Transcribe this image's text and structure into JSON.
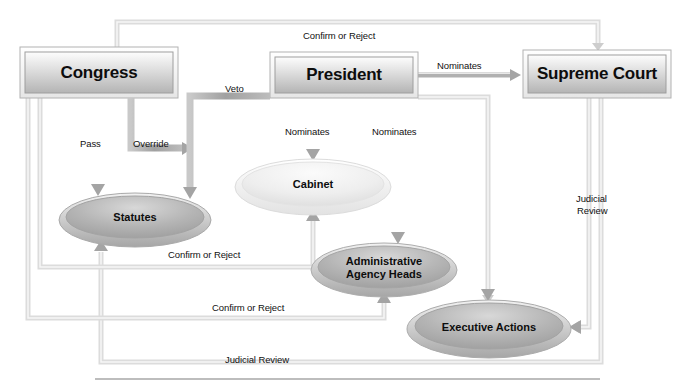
{
  "diagram": {
    "colors": {
      "box_fill_light": "#f3f3f3",
      "box_fill_dark": "#b9b9b9",
      "box_border": "#9b9b9b",
      "ellipse_dark": "#a8a8a8",
      "ellipse_light": "#ededed",
      "arrow_dark": "#a2a2a2",
      "arrow_light": "#dedede",
      "text": "#111111",
      "baseline_rule": "#b5b5b5"
    },
    "boxes": [
      {
        "id": "congress",
        "label": "Congress",
        "x": 20,
        "y": 47,
        "w": 158,
        "h": 51
      },
      {
        "id": "president",
        "label": "President",
        "x": 270,
        "y": 52,
        "w": 148,
        "h": 46
      },
      {
        "id": "supreme_court",
        "label": "Supreme Court",
        "x": 523,
        "y": 50,
        "w": 148,
        "h": 48
      }
    ],
    "ellipses": [
      {
        "id": "statutes",
        "label": "Statutes",
        "cx": 135,
        "cy": 218,
        "rx": 75,
        "ry": 26,
        "shade": "dark"
      },
      {
        "id": "cabinet",
        "label": "Cabinet",
        "cx": 313,
        "cy": 185,
        "rx": 77,
        "ry": 27,
        "shade": "light"
      },
      {
        "id": "agency_heads",
        "label": "Administrative\nAgency Heads",
        "cx": 384,
        "cy": 268,
        "rx": 72,
        "ry": 26,
        "shade": "dark"
      },
      {
        "id": "executive_actions",
        "label": "Executive Actions",
        "cx": 489,
        "cy": 327,
        "rx": 81,
        "ry": 28,
        "shade": "dark"
      }
    ],
    "edges": [
      {
        "id": "congress-pass-statutes",
        "label": "Pass",
        "from": "congress",
        "to": "statutes",
        "tone": "dark"
      },
      {
        "id": "congress-override-veto",
        "label": "Override",
        "from": "congress",
        "to": "statutes",
        "tone": "dark"
      },
      {
        "id": "president-veto-statutes",
        "label": "Veto",
        "from": "president",
        "to": "statutes",
        "tone": "dark"
      },
      {
        "id": "president-nominates-cabinet",
        "label": "Nominates",
        "from": "president",
        "to": "cabinet",
        "tone": "dark"
      },
      {
        "id": "president-nominates-agency-heads",
        "label": "Nominates",
        "from": "president",
        "to": "agency_heads",
        "tone": "dark"
      },
      {
        "id": "president-nominates-supreme-court",
        "label": "Nominates",
        "from": "president",
        "to": "supreme_court",
        "tone": "dark"
      },
      {
        "id": "congress-confirm-or-reject-court",
        "label": "Confirm or Reject",
        "from": "congress",
        "to": "supreme_court",
        "tone": "light"
      },
      {
        "id": "congress-confirm-or-reject-cabinet",
        "label": "Confirm or Reject",
        "from": "congress",
        "to": "cabinet",
        "tone": "light"
      },
      {
        "id": "congress-confirm-or-reject-agencies",
        "label": "Confirm or Reject",
        "from": "congress",
        "to": "agency_heads",
        "tone": "light"
      },
      {
        "id": "court-judicial-review-executive",
        "label": "Judicial\nReview",
        "from": "supreme_court",
        "to": "executive_actions",
        "tone": "light"
      },
      {
        "id": "court-judicial-review-statutes",
        "label": "Judicial Review",
        "from": "supreme_court",
        "to": "statutes",
        "tone": "light"
      },
      {
        "id": "president-to-executive-actions",
        "label": "",
        "from": "president",
        "to": "executive_actions",
        "tone": "light"
      }
    ],
    "edge_labels": [
      {
        "id": "label-confirm-or-reject-top",
        "text": "Confirm or Reject",
        "x": 303,
        "y": 31,
        "align": "left"
      },
      {
        "id": "label-veto",
        "text": "Veto",
        "x": 225,
        "y": 84,
        "align": "left"
      },
      {
        "id": "label-nominates-supreme-court",
        "text": "Nominates",
        "x": 437,
        "y": 61,
        "align": "left"
      },
      {
        "id": "label-pass",
        "text": "Pass",
        "x": 80,
        "y": 139,
        "align": "left"
      },
      {
        "id": "label-override",
        "text": "Override",
        "x": 133,
        "y": 139,
        "align": "left"
      },
      {
        "id": "label-nominates-cabinet",
        "text": "Nominates",
        "x": 285,
        "y": 127,
        "align": "left"
      },
      {
        "id": "label-nominates-agency-heads",
        "text": "Nominates",
        "x": 372,
        "y": 127,
        "align": "left"
      },
      {
        "id": "label-confirm-or-reject-cabinet",
        "text": "Confirm or Reject",
        "x": 168,
        "y": 250,
        "align": "left"
      },
      {
        "id": "label-confirm-or-reject-agency",
        "text": "Confirm or Reject",
        "x": 212,
        "y": 303,
        "align": "left"
      },
      {
        "id": "label-judicial-review-right",
        "text": "Judicial",
        "x": 576,
        "y": 194,
        "align": "left"
      },
      {
        "id": "label-judicial-review-right-2",
        "text": "Review",
        "x": 577,
        "y": 206,
        "align": "left"
      },
      {
        "id": "label-judicial-review-bottom",
        "text": "Judicial Review",
        "x": 225,
        "y": 355,
        "align": "left"
      }
    ]
  }
}
